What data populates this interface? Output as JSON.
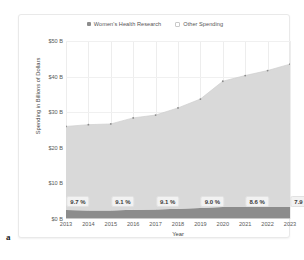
{
  "figure": {
    "letter": "a"
  },
  "legend": [
    {
      "label": "Women's Health Research",
      "marker": "filled-square",
      "color": "#8c8c8c"
    },
    {
      "label": "Other Spending",
      "marker": "open-square",
      "color": "#d9d9d9"
    }
  ],
  "axes": {
    "ylabel": "Spending in Billions of Dollars",
    "xlabel": "Year",
    "yticks": [
      "$0 B",
      "$10 B",
      "$20 B",
      "$30 B",
      "$40 B",
      "$50 B"
    ],
    "xticks": [
      "2013",
      "2014",
      "2015",
      "2016",
      "2017",
      "2018",
      "2019",
      "2020",
      "2021",
      "2022",
      "2023"
    ]
  },
  "chart_data": {
    "type": "area",
    "title": "",
    "subtitle": "",
    "xlabel": "Year",
    "ylabel": "Spending in Billions of Dollars",
    "ylim": [
      0,
      50
    ],
    "ytick_values": [
      0,
      10,
      20,
      30,
      40,
      50
    ],
    "ytick_labels": [
      "$0 B",
      "$10 B",
      "$20 B",
      "$30 B",
      "$40 B",
      "$50 B"
    ],
    "grid": true,
    "legend_position": "top-center",
    "stacked": true,
    "categories": [
      "2013",
      "2014",
      "2015",
      "2016",
      "2017",
      "2018",
      "2019",
      "2020",
      "2021",
      "2022",
      "2023"
    ],
    "series": [
      {
        "name": "Women's Health Research",
        "color": "#8c8c8c",
        "values": [
          2.5,
          2.4,
          2.4,
          2.6,
          2.7,
          2.9,
          3.1,
          3.4,
          3.4,
          3.4,
          3.4
        ]
      },
      {
        "name": "Other Spending",
        "color": "#d9d9d9",
        "values": [
          23.5,
          24.1,
          24.3,
          25.8,
          26.5,
          28.3,
          30.6,
          35.3,
          36.9,
          38.3,
          40.1
        ]
      }
    ],
    "totals": [
      26.0,
      26.5,
      26.7,
      28.4,
      29.2,
      31.2,
      33.7,
      38.7,
      40.3,
      41.7,
      43.5
    ],
    "annotations": [
      {
        "x": "2013",
        "text": "9.7 %"
      },
      {
        "x": "2015",
        "text": "9.1 %"
      },
      {
        "x": "2017",
        "text": "9.1 %"
      },
      {
        "x": "2019",
        "text": "9.0 %"
      },
      {
        "x": "2021",
        "text": "8.6 %"
      },
      {
        "x": "2023",
        "text": "7.9 %"
      }
    ]
  },
  "colors": {
    "womens_health": "#8c8c8c",
    "other_spending": "#d9d9d9",
    "grid": "#f0f0f0",
    "axis": "#c9c9c9",
    "text": "#5a5a5a"
  }
}
